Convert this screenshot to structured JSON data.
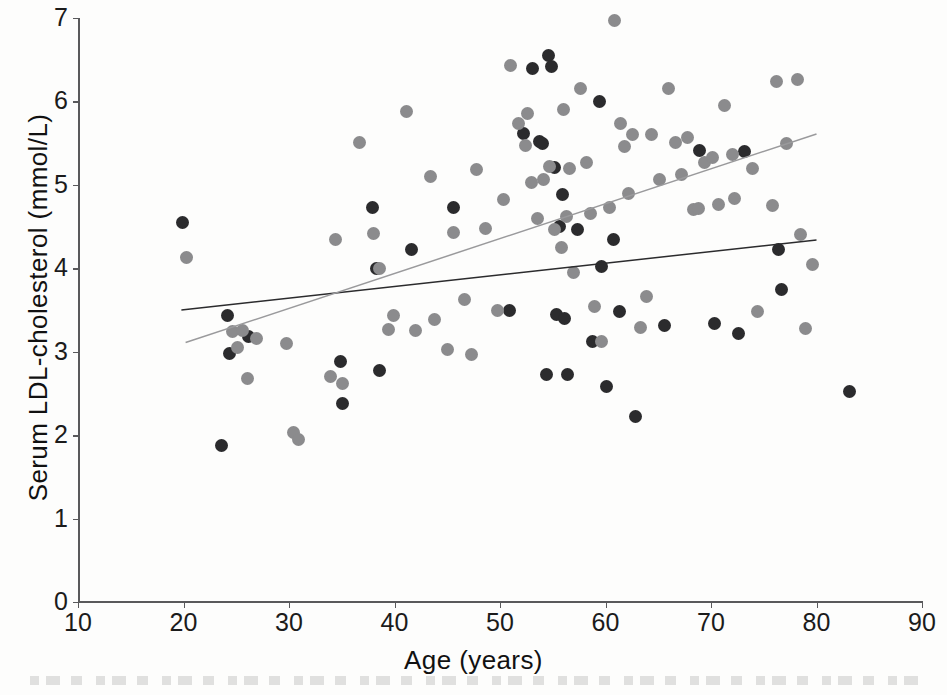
{
  "chart_data": {
    "type": "scatter",
    "title": "",
    "xlabel": "Age (years)",
    "ylabel": "Serum LDL-cholesterol (mmol/L)",
    "xlim": [
      10,
      90
    ],
    "ylim": [
      0,
      7
    ],
    "xticks": [
      10,
      20,
      30,
      40,
      50,
      60,
      70,
      80,
      90
    ],
    "yticks": [
      0,
      1,
      2,
      3,
      4,
      5,
      6,
      7
    ],
    "grid": false,
    "legend": "none",
    "colors": {
      "group_dark": "#2b2b2d",
      "group_light": "#8b8b8d",
      "fit_dark": "#2b2b2d",
      "fit_light": "#9a9a9c",
      "axis": "#59595b",
      "background": "#fdfdfc"
    },
    "series": [
      {
        "name": "group-dark",
        "color": "#2b2b2d",
        "marker": "filled-circle",
        "points": [
          [
            19.9,
            4.55
          ],
          [
            23.6,
            1.87
          ],
          [
            24.2,
            3.44
          ],
          [
            24.4,
            2.98
          ],
          [
            26.2,
            3.18
          ],
          [
            34.9,
            2.88
          ],
          [
            35.1,
            2.38
          ],
          [
            37.9,
            4.73
          ],
          [
            38.3,
            4.0
          ],
          [
            38.6,
            2.78
          ],
          [
            41.6,
            4.22
          ],
          [
            45.6,
            4.73
          ],
          [
            50.9,
            3.5
          ],
          [
            52.2,
            5.62
          ],
          [
            53.1,
            6.4
          ],
          [
            53.7,
            5.52
          ],
          [
            54.0,
            5.5
          ],
          [
            54.4,
            2.73
          ],
          [
            54.6,
            6.55
          ],
          [
            54.9,
            6.42
          ],
          [
            55.2,
            5.21
          ],
          [
            55.4,
            3.45
          ],
          [
            55.6,
            4.5
          ],
          [
            55.9,
            4.88
          ],
          [
            56.1,
            3.4
          ],
          [
            56.4,
            2.73
          ],
          [
            57.3,
            4.47
          ],
          [
            58.8,
            3.12
          ],
          [
            59.4,
            6.0
          ],
          [
            59.6,
            4.02
          ],
          [
            60.1,
            2.58
          ],
          [
            60.8,
            4.35
          ],
          [
            61.3,
            3.48
          ],
          [
            62.8,
            2.22
          ],
          [
            65.6,
            3.31
          ],
          [
            68.9,
            5.41
          ],
          [
            70.3,
            3.34
          ],
          [
            72.6,
            3.22
          ],
          [
            73.2,
            5.4
          ],
          [
            76.4,
            4.22
          ],
          [
            76.7,
            3.74
          ],
          [
            83.1,
            2.52
          ]
        ]
      },
      {
        "name": "group-light",
        "color": "#8b8b8d",
        "marker": "filled-circle",
        "points": [
          [
            20.3,
            4.13
          ],
          [
            24.6,
            3.24
          ],
          [
            25.1,
            3.05
          ],
          [
            25.6,
            3.26
          ],
          [
            26.1,
            2.68
          ],
          [
            26.9,
            3.16
          ],
          [
            29.8,
            3.1
          ],
          [
            30.4,
            2.03
          ],
          [
            30.9,
            1.95
          ],
          [
            33.9,
            2.7
          ],
          [
            34.4,
            4.34
          ],
          [
            35.1,
            2.62
          ],
          [
            36.7,
            5.51
          ],
          [
            38.0,
            4.42
          ],
          [
            38.6,
            4.0
          ],
          [
            39.4,
            3.27
          ],
          [
            39.9,
            3.44
          ],
          [
            41.1,
            5.88
          ],
          [
            42.0,
            3.25
          ],
          [
            43.4,
            5.1
          ],
          [
            43.8,
            3.39
          ],
          [
            45.0,
            3.03
          ],
          [
            45.6,
            4.43
          ],
          [
            46.6,
            3.62
          ],
          [
            47.3,
            2.97
          ],
          [
            47.8,
            5.18
          ],
          [
            48.6,
            4.48
          ],
          [
            49.8,
            3.5
          ],
          [
            50.3,
            4.82
          ],
          [
            51.0,
            6.43
          ],
          [
            51.8,
            5.74
          ],
          [
            52.4,
            5.47
          ],
          [
            52.6,
            5.86
          ],
          [
            53.0,
            5.03
          ],
          [
            53.6,
            4.6
          ],
          [
            54.1,
            5.07
          ],
          [
            54.7,
            5.22
          ],
          [
            55.2,
            4.46
          ],
          [
            55.8,
            4.25
          ],
          [
            56.0,
            5.9
          ],
          [
            56.3,
            4.62
          ],
          [
            56.6,
            5.2
          ],
          [
            57.0,
            3.95
          ],
          [
            57.6,
            6.15
          ],
          [
            58.2,
            5.27
          ],
          [
            58.6,
            4.66
          ],
          [
            59.0,
            3.54
          ],
          [
            59.6,
            3.12
          ],
          [
            60.4,
            4.73
          ],
          [
            60.9,
            6.97
          ],
          [
            61.4,
            5.73
          ],
          [
            61.8,
            5.46
          ],
          [
            62.2,
            4.9
          ],
          [
            62.6,
            5.6
          ],
          [
            63.3,
            3.29
          ],
          [
            63.9,
            3.66
          ],
          [
            64.4,
            5.6
          ],
          [
            65.1,
            5.06
          ],
          [
            66.0,
            6.16
          ],
          [
            66.6,
            5.51
          ],
          [
            67.2,
            5.12
          ],
          [
            67.8,
            5.57
          ],
          [
            68.3,
            4.7
          ],
          [
            68.8,
            4.72
          ],
          [
            69.4,
            5.27
          ],
          [
            70.1,
            5.33
          ],
          [
            70.7,
            4.76
          ],
          [
            71.3,
            5.95
          ],
          [
            72.0,
            5.36
          ],
          [
            72.2,
            4.84
          ],
          [
            73.9,
            5.2
          ],
          [
            74.4,
            3.48
          ],
          [
            75.8,
            4.75
          ],
          [
            76.2,
            6.24
          ],
          [
            77.2,
            5.5
          ],
          [
            78.2,
            6.26
          ],
          [
            78.5,
            4.41
          ],
          [
            79.0,
            3.28
          ],
          [
            79.6,
            4.05
          ]
        ]
      }
    ],
    "fit_lines": [
      {
        "name": "fit-dark",
        "color": "#2b2b2d",
        "x": [
          19.8,
          80.0
        ],
        "y": [
          3.5,
          4.34
        ],
        "style": "solid"
      },
      {
        "name": "fit-light",
        "color": "#9a9a9c",
        "x": [
          20.2,
          80.0
        ],
        "y": [
          3.11,
          5.61
        ],
        "style": "solid"
      }
    ]
  }
}
